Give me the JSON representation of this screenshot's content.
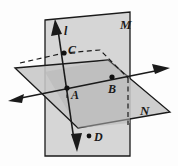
{
  "figure": {
    "canvas": {
      "width": 178,
      "height": 166
    },
    "background_color": "#fdfdfd",
    "stroke_color": "#1a1a1a",
    "plane_fill_vertical": "#d4d4d4",
    "plane_fill_horizontal": "#c9c9c9",
    "plane_fill_overlap": "#b8b8b8",
    "labels": {
      "plane_vertical": "M",
      "plane_horizontal": "N",
      "line": "l",
      "point_c": "C",
      "point_a": "A",
      "point_b": "B",
      "point_d": "D"
    },
    "points": [
      {
        "name": "C",
        "x": 64,
        "y": 53
      },
      {
        "name": "A",
        "x": 67,
        "y": 88
      },
      {
        "name": "B",
        "x": 112,
        "y": 77
      },
      {
        "name": "D",
        "x": 89,
        "y": 136
      }
    ]
  }
}
